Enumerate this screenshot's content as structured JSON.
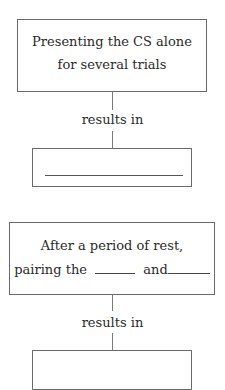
{
  "diagram": {
    "top_box": {
      "line1": "Presenting the CS alone",
      "line2": "for several trials"
    },
    "top_connector_label": "results in",
    "top_answer_box": {
      "blank": ""
    },
    "bottom_box": {
      "line1": "After a period of rest,",
      "line2_prefix": "pairing the",
      "line2_middle": "and",
      "blank1": "",
      "blank2": ""
    },
    "bottom_connector_label": "results in",
    "bottom_answer_box": {
      "blank": ""
    }
  }
}
